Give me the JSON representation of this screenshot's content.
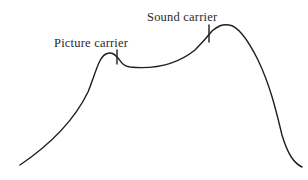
{
  "diagram": {
    "type": "frequency-response-curve",
    "labels": {
      "picture_carrier": "Picture carrier",
      "sound_carrier": "Sound carrier"
    },
    "colors": {
      "line": "#1e1e1e",
      "text": "#2a2a2a",
      "background": "#ffffff"
    },
    "markers": [
      {
        "name": "picture-carrier",
        "x": 117,
        "y_top": 50,
        "y_bottom": 64
      },
      {
        "name": "sound-carrier",
        "x": 209,
        "y_top": 25,
        "y_bottom": 42
      }
    ],
    "curve_points": [
      {
        "x": 20,
        "y": 165
      },
      {
        "x": 108,
        "y": 53
      },
      {
        "x": 128,
        "y": 67
      },
      {
        "x": 209,
        "y": 33
      },
      {
        "x": 225,
        "y": 25
      },
      {
        "x": 302,
        "y": 167
      }
    ]
  }
}
